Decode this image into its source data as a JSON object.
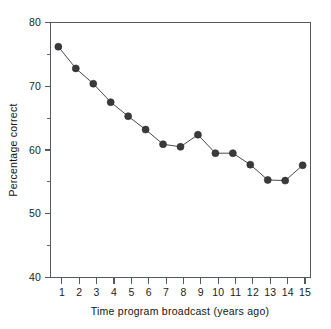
{
  "chart_data": {
    "type": "line",
    "title": "",
    "subtitle": "",
    "xlabel": "Time program broadcast (years ago)",
    "ylabel": "Percentage correct",
    "x": [
      1,
      2,
      3,
      4,
      5,
      6,
      7,
      8,
      9,
      10,
      11,
      12,
      13,
      14,
      15
    ],
    "values": [
      76.2,
      72.8,
      70.4,
      67.5,
      65.3,
      63.2,
      60.9,
      60.5,
      62.4,
      59.5,
      59.5,
      57.7,
      55.3,
      55.2,
      57.6
    ],
    "series": [
      {
        "name": "Percentage correct",
        "values": [
          76.2,
          72.8,
          70.4,
          67.5,
          65.3,
          63.2,
          60.9,
          60.5,
          62.4,
          59.5,
          59.5,
          57.7,
          55.3,
          55.2,
          57.6
        ]
      }
    ],
    "xlim": [
      0.55,
      15.45
    ],
    "ylim": [
      40,
      80
    ],
    "x_tick_labels": [
      "1",
      "2",
      "3",
      "4",
      "5",
      "6",
      "7",
      "8",
      "9",
      "10",
      "11",
      "12",
      "13",
      "14",
      "15"
    ],
    "y_tick_labels": [
      "80",
      "70",
      "60",
      "50",
      "40"
    ],
    "y_ticks_major": [
      80,
      70,
      60,
      50,
      40
    ],
    "y_ticks_minor": [
      75,
      65,
      55,
      45
    ],
    "grid": false,
    "legend": false,
    "legend_position": "none",
    "marker": "filled-circle",
    "marker_color": "#3a3a3a",
    "line_color": "#4a4a4a",
    "axis_color": "#555a5e",
    "background": "#ffffff",
    "annotations": []
  }
}
